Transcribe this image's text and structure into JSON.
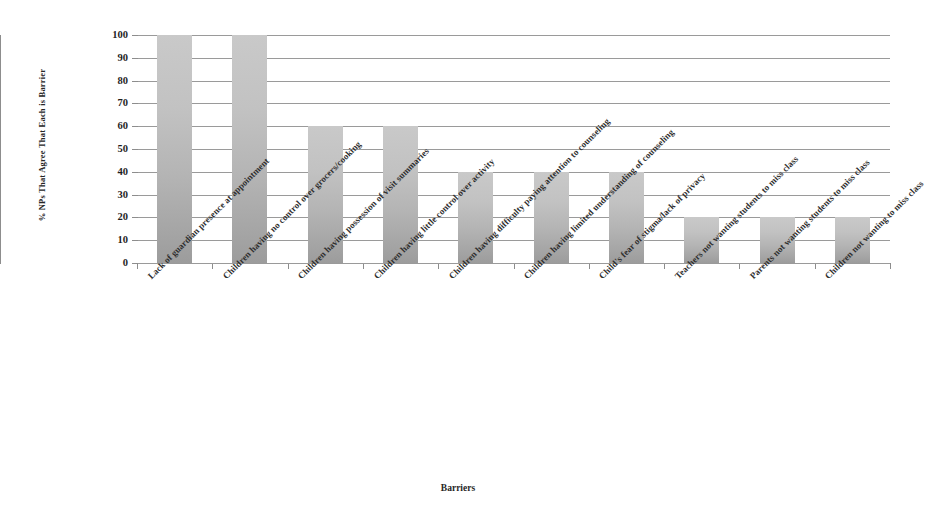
{
  "chart_data": {
    "type": "bar",
    "title": "",
    "xlabel": "Barriers",
    "ylabel": "% NPs That Agree That Each is  Barrier",
    "ylim": [
      0,
      100
    ],
    "yticks": [
      0,
      10,
      20,
      30,
      40,
      50,
      60,
      70,
      80,
      90,
      100
    ],
    "grid": true,
    "legend": "none",
    "bar_color": "#bdbdbd",
    "categories": [
      "Lack of guardian presence at appointment",
      "Children having no control over grocers/cooking",
      "Children having possession of visit summaries",
      "Children having little control over activity",
      "Children having difficulty paying attention to counseling",
      "Children having limited understanding of counseling",
      "Child's fear of stigma/lack of privacy",
      "Teachers not wanting students to miss class",
      "Parents not wanting students to miss class",
      "Children not wanting to miss class"
    ],
    "values": [
      100,
      100,
      60,
      60,
      40,
      40,
      40,
      20,
      20,
      20
    ]
  }
}
